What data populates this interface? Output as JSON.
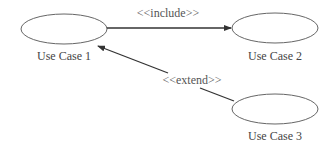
{
  "diagram": {
    "type": "uml-use-case",
    "colors": {
      "stroke": "#555555",
      "arrow": "#333333",
      "text": "#444444",
      "background": "#ffffff"
    },
    "use_cases": [
      {
        "id": "uc1",
        "label": "Use Case 1",
        "cx": 64,
        "cy": 29
      },
      {
        "id": "uc2",
        "label": "Use Case 2",
        "cx": 275,
        "cy": 28
      },
      {
        "id": "uc3",
        "label": "Use Case 3",
        "cx": 275,
        "cy": 109
      }
    ],
    "relationships": [
      {
        "from": "uc1",
        "to": "uc2",
        "stereotype": "<<include>>"
      },
      {
        "from": "uc3",
        "to": "uc1",
        "stereotype": "<<extend>>"
      }
    ]
  }
}
